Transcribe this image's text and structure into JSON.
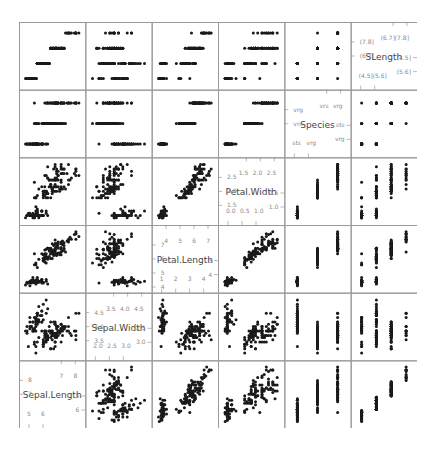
{
  "chart_data": {
    "type": "scatter",
    "subtype": "scatterplot-matrix",
    "title": "",
    "variables": [
      "SLength",
      "Species",
      "Petal.Width",
      "Petal.Length",
      "Sepal.Width",
      "Sepal.Length"
    ],
    "diagonal_order_top_to_bottom": [
      "SLength",
      "Species",
      "Petal.Width",
      "Petal.Length",
      "Sepal.Width",
      "Sepal.Length"
    ],
    "axes": {
      "SLength": {
        "range": [
          4.0,
          8.3
        ],
        "ticks_low": [
          "(4.5]",
          "(5.6]"
        ],
        "ticks_high": [
          "(6.7]",
          "(7.8]"
        ],
        "levels": [
          "(4.5]",
          "(5.6]",
          "(6.7]",
          "(7.8]"
        ]
      },
      "Species": {
        "levels": [
          "sts",
          "vrs",
          "vrg"
        ],
        "ticks_low": [
          "sts",
          "vrg"
        ],
        "ticks_high": [
          "vrs",
          "vrg"
        ]
      },
      "Petal.Width": {
        "range": [
          0.0,
          2.6
        ],
        "ticks_low": [
          "0.0",
          "0.5",
          "1.0"
        ],
        "ticks_high": [
          "1.5",
          "2.0",
          "2.5"
        ]
      },
      "Petal.Length": {
        "range": [
          0.8,
          7.1
        ],
        "ticks_low": [
          "1",
          "2",
          "3",
          "4"
        ],
        "ticks_high": [
          "4",
          "5",
          "6",
          "7"
        ]
      },
      "Sepal.Width": {
        "range": [
          1.9,
          4.5
        ],
        "ticks_low": [
          "2.0",
          "2.5",
          "3.0"
        ],
        "ticks_high": [
          "3.5",
          "4.0",
          "4.5"
        ]
      },
      "Sepal.Length": {
        "range": [
          4.2,
          8.0
        ],
        "ticks_low": [
          "5",
          "6"
        ],
        "ticks_high": [
          "7",
          "8"
        ]
      }
    },
    "grid": false,
    "legend": "none",
    "point_color": "#1a1a1a",
    "panel_border_color": "#9a9a9a",
    "tick_label_color": "#8a8a8a",
    "diag_label_color": "#444444",
    "dataset": "iris",
    "n_points": 150,
    "seed_note": "points reproduce the iris dataset (50 setosa, 50 versicolor, 50 virginica)",
    "iris": {
      "sepal_length": [
        5.1,
        4.9,
        4.7,
        4.6,
        5.0,
        5.4,
        4.6,
        5.0,
        4.4,
        4.9,
        5.4,
        4.8,
        4.8,
        4.3,
        5.8,
        5.7,
        5.4,
        5.1,
        5.7,
        5.1,
        5.4,
        5.1,
        4.6,
        5.1,
        4.8,
        5.0,
        5.0,
        5.2,
        5.2,
        4.7,
        4.8,
        5.4,
        5.2,
        5.5,
        4.9,
        5.0,
        5.5,
        4.9,
        4.4,
        5.1,
        5.0,
        4.5,
        4.4,
        5.0,
        5.1,
        4.8,
        5.1,
        4.6,
        5.3,
        5.0,
        7.0,
        6.4,
        6.9,
        5.5,
        6.5,
        5.7,
        6.3,
        4.9,
        6.6,
        5.2,
        5.0,
        5.9,
        6.0,
        6.1,
        5.6,
        6.7,
        5.6,
        5.8,
        6.2,
        5.6,
        5.9,
        6.1,
        6.3,
        6.1,
        6.4,
        6.6,
        6.8,
        6.7,
        6.0,
        5.7,
        5.5,
        5.5,
        5.8,
        6.0,
        5.4,
        6.0,
        6.7,
        6.3,
        5.6,
        5.5,
        5.5,
        6.1,
        5.8,
        5.0,
        5.6,
        5.7,
        5.7,
        6.2,
        5.1,
        5.7,
        6.3,
        5.8,
        7.1,
        6.3,
        6.5,
        7.6,
        4.9,
        7.3,
        6.7,
        7.2,
        6.5,
        6.4,
        6.8,
        5.7,
        5.8,
        6.4,
        6.5,
        7.7,
        7.7,
        6.0,
        6.9,
        5.6,
        7.7,
        6.3,
        6.7,
        7.2,
        6.2,
        6.1,
        6.4,
        7.2,
        7.4,
        7.9,
        6.4,
        6.3,
        6.1,
        7.7,
        6.3,
        6.4,
        6.0,
        6.9,
        6.7,
        6.9,
        5.8,
        6.8,
        6.7,
        6.7,
        6.3,
        6.5,
        6.2,
        5.9
      ],
      "sepal_width": [
        3.5,
        3.0,
        3.2,
        3.1,
        3.6,
        3.9,
        3.4,
        3.4,
        2.9,
        3.1,
        3.7,
        3.4,
        3.0,
        3.0,
        4.0,
        4.4,
        3.9,
        3.5,
        3.8,
        3.8,
        3.4,
        3.7,
        3.6,
        3.3,
        3.4,
        3.0,
        3.4,
        3.5,
        3.4,
        3.2,
        3.1,
        3.4,
        4.1,
        4.2,
        3.1,
        3.2,
        3.5,
        3.6,
        3.0,
        3.4,
        3.5,
        2.3,
        3.2,
        3.5,
        3.8,
        3.0,
        3.8,
        3.2,
        3.7,
        3.3,
        3.2,
        3.2,
        3.1,
        2.3,
        2.8,
        2.8,
        3.3,
        2.4,
        2.9,
        2.7,
        2.0,
        3.0,
        2.2,
        2.9,
        2.9,
        3.1,
        3.0,
        2.7,
        2.2,
        2.5,
        3.2,
        2.8,
        2.5,
        2.8,
        2.9,
        3.0,
        2.8,
        3.0,
        2.9,
        2.6,
        2.4,
        2.4,
        2.7,
        2.7,
        3.0,
        3.4,
        3.1,
        2.3,
        3.0,
        2.5,
        2.6,
        3.0,
        2.6,
        2.3,
        2.7,
        3.0,
        2.9,
        2.9,
        2.5,
        2.8,
        3.3,
        2.7,
        3.0,
        2.9,
        3.0,
        3.0,
        2.5,
        2.9,
        2.5,
        3.6,
        3.2,
        2.7,
        3.0,
        2.5,
        2.8,
        3.2,
        3.0,
        3.8,
        2.6,
        2.2,
        3.2,
        2.8,
        2.8,
        2.7,
        3.3,
        3.2,
        2.8,
        3.0,
        2.8,
        3.0,
        2.8,
        3.8,
        2.8,
        2.8,
        2.6,
        3.0,
        3.4,
        3.1,
        3.0,
        3.1,
        3.1,
        3.1,
        2.7,
        3.2,
        3.3,
        3.0,
        2.5,
        3.0,
        3.4,
        3.0
      ],
      "petal_length": [
        1.4,
        1.4,
        1.3,
        1.5,
        1.4,
        1.7,
        1.4,
        1.5,
        1.4,
        1.5,
        1.5,
        1.6,
        1.4,
        1.1,
        1.2,
        1.5,
        1.3,
        1.4,
        1.7,
        1.5,
        1.7,
        1.5,
        1.0,
        1.7,
        1.9,
        1.6,
        1.6,
        1.5,
        1.4,
        1.6,
        1.6,
        1.5,
        1.5,
        1.4,
        1.5,
        1.2,
        1.3,
        1.4,
        1.3,
        1.5,
        1.3,
        1.3,
        1.3,
        1.6,
        1.9,
        1.4,
        1.6,
        1.4,
        1.5,
        1.4,
        4.7,
        4.5,
        4.9,
        4.0,
        4.6,
        4.5,
        4.7,
        3.3,
        4.6,
        3.9,
        3.5,
        4.2,
        4.0,
        4.7,
        3.6,
        4.4,
        4.5,
        4.1,
        4.5,
        3.9,
        4.8,
        4.0,
        4.9,
        4.7,
        4.3,
        4.4,
        4.8,
        5.0,
        4.5,
        3.5,
        3.8,
        3.7,
        3.9,
        5.1,
        4.5,
        4.5,
        4.7,
        4.4,
        4.1,
        4.0,
        4.4,
        4.6,
        4.0,
        3.3,
        4.2,
        4.2,
        4.2,
        4.3,
        3.0,
        4.1,
        6.0,
        5.1,
        5.9,
        5.6,
        5.8,
        6.6,
        4.5,
        6.3,
        5.8,
        6.1,
        5.1,
        5.3,
        5.5,
        5.0,
        5.1,
        5.3,
        5.5,
        6.7,
        6.9,
        5.0,
        5.7,
        4.9,
        6.7,
        4.9,
        5.7,
        6.0,
        4.8,
        4.9,
        5.6,
        5.8,
        6.1,
        6.4,
        5.6,
        5.1,
        5.6,
        6.1,
        5.6,
        5.5,
        4.8,
        5.4,
        5.6,
        5.1,
        5.1,
        5.9,
        5.7,
        5.2,
        5.0,
        5.2,
        5.4,
        5.1
      ],
      "petal_width": [
        0.2,
        0.2,
        0.2,
        0.2,
        0.2,
        0.4,
        0.3,
        0.2,
        0.2,
        0.1,
        0.2,
        0.2,
        0.1,
        0.1,
        0.2,
        0.4,
        0.4,
        0.3,
        0.3,
        0.3,
        0.2,
        0.4,
        0.2,
        0.5,
        0.2,
        0.2,
        0.4,
        0.2,
        0.2,
        0.2,
        0.2,
        0.4,
        0.1,
        0.2,
        0.2,
        0.2,
        0.2,
        0.1,
        0.2,
        0.2,
        0.3,
        0.3,
        0.2,
        0.6,
        0.4,
        0.3,
        0.2,
        0.2,
        0.2,
        0.2,
        1.4,
        1.5,
        1.5,
        1.3,
        1.5,
        1.3,
        1.6,
        1.0,
        1.3,
        1.4,
        1.0,
        1.5,
        1.0,
        1.4,
        1.3,
        1.4,
        1.5,
        1.0,
        1.5,
        1.1,
        1.8,
        1.3,
        1.5,
        1.2,
        1.3,
        1.4,
        1.4,
        1.7,
        1.5,
        1.0,
        1.1,
        1.0,
        1.2,
        1.6,
        1.5,
        1.6,
        1.5,
        1.3,
        1.3,
        1.3,
        1.2,
        1.4,
        1.2,
        1.0,
        1.3,
        1.2,
        1.3,
        1.3,
        1.1,
        1.3,
        2.5,
        1.9,
        2.1,
        1.8,
        2.2,
        2.1,
        1.7,
        1.8,
        1.8,
        2.5,
        2.0,
        1.9,
        2.1,
        2.0,
        2.4,
        2.3,
        1.8,
        2.2,
        2.3,
        1.5,
        2.3,
        2.0,
        2.0,
        1.8,
        2.1,
        1.8,
        1.8,
        1.8,
        2.1,
        1.6,
        1.9,
        2.0,
        2.2,
        1.5,
        1.4,
        2.3,
        2.4,
        1.8,
        1.8,
        2.1,
        2.4,
        2.3,
        1.9,
        2.3,
        2.5,
        2.3,
        1.9,
        2.0,
        2.3,
        1.8
      ]
    }
  }
}
